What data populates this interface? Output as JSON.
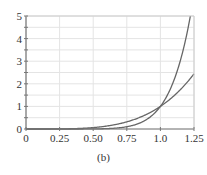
{
  "chart_data": {
    "type": "line",
    "title": "",
    "caption": "(b)",
    "xlabel": "",
    "ylabel": "",
    "xlim": [
      0,
      1.25
    ],
    "ylim": [
      0,
      5
    ],
    "grid": true,
    "legend": null,
    "x_ticks": [
      0,
      0.25,
      0.5,
      0.75,
      1.0,
      1.25
    ],
    "x_tick_labels": [
      "0",
      "0.25",
      "0.50",
      "0.75",
      "1.0",
      "1.25"
    ],
    "y_ticks": [
      0,
      1,
      2,
      3,
      4,
      5
    ],
    "y_tick_labels": [
      "0",
      "1",
      "2",
      "3",
      "4",
      "5"
    ],
    "series": [
      {
        "name": "y = x^4",
        "x": [
          0,
          0.25,
          0.5,
          0.75,
          1.0,
          1.1,
          1.2,
          1.25
        ],
        "values": [
          0,
          0.004,
          0.0625,
          0.316,
          1.0,
          1.464,
          2.074,
          2.441
        ]
      },
      {
        "name": "y = x^8",
        "x": [
          0,
          0.25,
          0.5,
          0.75,
          1.0,
          1.1,
          1.2,
          1.22
        ],
        "values": [
          0,
          2e-05,
          0.0039,
          0.1,
          1.0,
          2.144,
          4.3,
          4.91
        ]
      }
    ],
    "intersection": {
      "x": 1.0,
      "y": 1.0
    },
    "colors": {
      "curve": "#666666",
      "axis": "#777777",
      "grid": "#e4e4e4",
      "text": "#333333"
    }
  }
}
